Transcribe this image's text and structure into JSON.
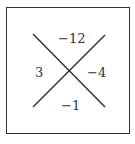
{
  "diagram": {
    "type": "x-factor",
    "top": "−12",
    "left": "3",
    "right": "−4",
    "bottom": "−1",
    "line_color": "#333333"
  }
}
